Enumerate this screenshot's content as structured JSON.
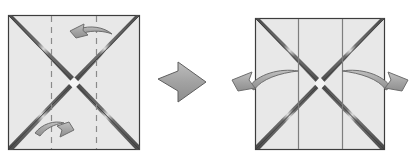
{
  "diagram": {
    "type": "origami-instruction",
    "canvas": {
      "width": 417,
      "height": 166,
      "background": "#ffffff"
    },
    "colors": {
      "paper_fill": "#e8e8e8",
      "paper_edge": "#3d3d3d",
      "crease_dark": "#4a4a4a",
      "crease_light": "#f2f2f2",
      "dashed_line": "#8a8a8a",
      "solid_crease": "#7e7e7e",
      "arrow_fill": "#a8a8a8",
      "arrow_stroke": "#6e6e6e",
      "transition_arrow_fill": "#a5a5a5",
      "transition_arrow_stroke": "#5f5f5f"
    },
    "panels": [
      {
        "id": "before",
        "name": "left-panel",
        "label": "",
        "square": {
          "x": 8,
          "y": 15,
          "width": 132,
          "height": 135
        },
        "diagonals": [
          "top-left-to-bottom-right",
          "top-right-to-bottom-left"
        ],
        "vertical_lines": {
          "style": "dashed",
          "count": 2,
          "positions_fraction": [
            0.333,
            0.667
          ],
          "positions_px": [
            51,
            96
          ]
        },
        "arrows": [
          {
            "name": "fold-arrow-top",
            "direction": "right-to-left",
            "head": "left",
            "position": "upper-right-of-center"
          },
          {
            "name": "fold-arrow-bottom",
            "direction": "left-to-right",
            "head": "right",
            "position": "lower-left-of-center"
          }
        ]
      },
      {
        "id": "after",
        "name": "right-panel",
        "label": "",
        "square": {
          "x": 255,
          "y": 18,
          "width": 130,
          "height": 132
        },
        "diagonals": [
          "top-left-to-bottom-right",
          "top-right-to-bottom-left"
        ],
        "vertical_lines": {
          "style": "solid",
          "count": 2,
          "positions_fraction": [
            0.333,
            0.667
          ],
          "positions_px": [
            298,
            342
          ]
        },
        "arrows": [
          {
            "name": "unfold-arrow-left",
            "direction": "inward-to-outward-left",
            "head": "left",
            "position": "mid-height-left-edge"
          },
          {
            "name": "unfold-arrow-right",
            "direction": "inward-to-outward-right",
            "head": "right",
            "position": "mid-height-right-edge"
          }
        ]
      }
    ],
    "transition": {
      "name": "step-transition-arrow",
      "shape": "block-arrow",
      "direction": "right",
      "x": 158,
      "y": 62,
      "width": 48,
      "height": 40
    }
  }
}
